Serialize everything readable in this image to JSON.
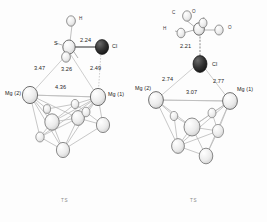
{
  "figure": {
    "background": "#fdfdfd",
    "panel_count": 2
  },
  "colors": {
    "bond": "#9a9a9a",
    "thin_bond": "#b4b4b4",
    "atom_light": "#e8e8e8",
    "atom_outline": "#6e6e6e",
    "atom_dark": "#2b2b2b",
    "text": "#1f1f1f",
    "muted": "#8a8a8a"
  },
  "left": {
    "caption": "TS",
    "atoms": [
      {
        "id": "H-top",
        "label": "H",
        "kind": "light-small"
      },
      {
        "id": "S",
        "label": "S",
        "kind": "light"
      },
      {
        "id": "Cl",
        "label": "Cl",
        "kind": "dark"
      },
      {
        "id": "Mg2",
        "label": "Mg (2)",
        "kind": "light"
      },
      {
        "id": "Mg1",
        "label": "Mg (1)",
        "kind": "light"
      }
    ],
    "distances": [
      {
        "id": "S-Cl",
        "value": "2.24"
      },
      {
        "id": "S-Mg2",
        "value": "3.47"
      },
      {
        "id": "S-Mg1",
        "value": "3.26"
      },
      {
        "id": "Cl-Mg1",
        "value": "2.49"
      },
      {
        "id": "Mg2-Mg1",
        "value": "4.36"
      }
    ]
  },
  "right": {
    "caption": "TS",
    "atoms": [
      {
        "id": "C",
        "label": "C",
        "kind": "light-small"
      },
      {
        "id": "O-top",
        "label": "O",
        "kind": "light"
      },
      {
        "id": "O-right",
        "label": "O",
        "kind": "light"
      },
      {
        "id": "H",
        "label": "H",
        "kind": "light-small"
      },
      {
        "id": "Cl",
        "label": "Cl",
        "kind": "dark"
      },
      {
        "id": "Mg2",
        "label": "Mg (2)",
        "kind": "light"
      },
      {
        "id": "Mg1",
        "label": "Mg (1)",
        "kind": "light"
      }
    ],
    "distances": [
      {
        "id": "C-Cl",
        "value": "2.21"
      },
      {
        "id": "Cl-Mg2",
        "value": "2.74"
      },
      {
        "id": "Cl-Mg1",
        "value": "2.77"
      },
      {
        "id": "Mg2-Mg1",
        "value": "3.07"
      }
    ]
  }
}
